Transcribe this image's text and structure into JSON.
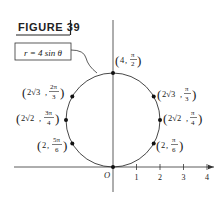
{
  "figure": {
    "title": "FIGURE 39",
    "equation": "r = 4 sin θ"
  },
  "axes": {
    "origin_label": "O",
    "x_ticks": [
      "1",
      "2",
      "3",
      "4"
    ]
  },
  "points": [
    {
      "r": "4",
      "theta": "π/2",
      "label_r": "4",
      "num": "π",
      "den": "2"
    },
    {
      "r": "2√3",
      "theta": "π/3",
      "label_r": "2√3",
      "num": "π",
      "den": "3"
    },
    {
      "r": "2√2",
      "theta": "π/4",
      "label_r": "2√2",
      "num": "π",
      "den": "4"
    },
    {
      "r": "2",
      "theta": "π/6",
      "label_r": "2",
      "num": "π",
      "den": "6"
    },
    {
      "r": "2√3",
      "theta": "2π/3",
      "label_r": "2√3",
      "num": "2π",
      "den": "3"
    },
    {
      "r": "2√2",
      "theta": "3π/4",
      "label_r": "2√2",
      "num": "3π",
      "den": "4"
    },
    {
      "r": "2",
      "theta": "5π/6",
      "label_r": "2",
      "num": "5π",
      "den": "6"
    },
    {
      "r": "0",
      "theta": "0",
      "label_r": "O"
    }
  ],
  "colors": {
    "ink": "#1a1a1a",
    "background": "#ffffff"
  }
}
